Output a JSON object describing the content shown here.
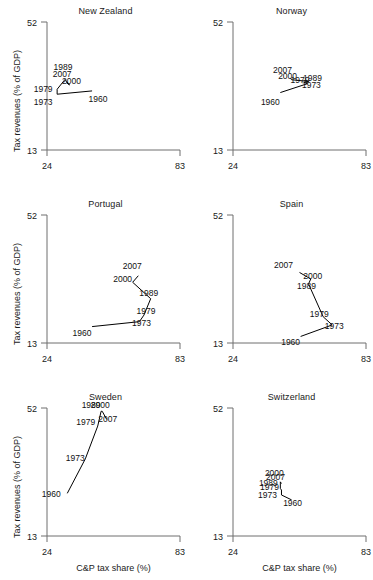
{
  "figure": {
    "axis_labels": {
      "y": "Tax revenues (% of GDP)",
      "x": "C&P tax share (%)"
    },
    "ticks": {
      "y_min": "13",
      "y_max": "52",
      "x_min": "24",
      "x_max": "83"
    },
    "colors": {
      "axis": "#6e6e6e",
      "data_line": "#000000",
      "text": "#1a1a1a",
      "background": "#ffffff"
    }
  },
  "chart_data": {
    "type": "line",
    "title": "",
    "xlabel": "C&P tax share (%)",
    "ylabel": "Tax revenues (% of GDP)",
    "xlim": [
      24,
      83
    ],
    "ylim": [
      13,
      52
    ],
    "grid": false,
    "legend": "none",
    "annotation_note": "Each panel is a connected scatter of one country over time; each point is labelled with its year.",
    "panels": [
      {
        "name": "New Zealand",
        "years": [
          "1960",
          "1973",
          "1979",
          "1989",
          "2000",
          "2007"
        ],
        "x": [
          44.0,
          28.5,
          28.5,
          32.0,
          34.0,
          32.5
        ],
        "y": [
          31.0,
          30.0,
          31.5,
          34.5,
          32.8,
          33.6
        ],
        "label_offsets": [
          {
            "dx": 6,
            "dy": 11
          },
          {
            "dx": -14,
            "dy": 11
          },
          {
            "dx": -14,
            "dy": 3
          },
          {
            "dx": -2,
            "dy": -9
          },
          {
            "dx": 2,
            "dy": -1
          },
          {
            "dx": -4,
            "dy": -5
          }
        ]
      },
      {
        "name": "Norway",
        "years": [
          "1960",
          "1973",
          "1979",
          "1989",
          "2000",
          "2007"
        ],
        "x": [
          45.0,
          57.0,
          55.5,
          57.5,
          50.0,
          49.5
        ],
        "y": [
          30.5,
          33.2,
          33.6,
          33.9,
          34.4,
          34.8
        ],
        "label_offsets": [
          {
            "dx": -10,
            "dy": 12
          },
          {
            "dx": 4,
            "dy": 4
          },
          {
            "dx": -4,
            "dy": 1
          },
          {
            "dx": 4,
            "dy": 0
          },
          {
            "dx": -4,
            "dy": -1
          },
          {
            "dx": -8,
            "dy": -5
          }
        ]
      },
      {
        "name": "Portugal",
        "years": [
          "1960",
          "1973",
          "1979",
          "1989",
          "2000",
          "2007"
        ],
        "x": [
          44.0,
          65.0,
          67.0,
          70.0,
          62.0,
          64.5
        ],
        "y": [
          18.0,
          19.5,
          21.5,
          26.5,
          31.5,
          33.5
        ],
        "label_offsets": [
          {
            "dx": -10,
            "dy": 9
          },
          {
            "dx": 2,
            "dy": 4
          },
          {
            "dx": 2,
            "dy": -1
          },
          {
            "dx": -2,
            "dy": -3
          },
          {
            "dx": -10,
            "dy": 0
          },
          {
            "dx": -6,
            "dy": -7
          }
        ]
      },
      {
        "name": "Spain",
        "years": [
          "1960",
          "1973",
          "1979",
          "1989",
          "2000",
          "2007"
        ],
        "x": [
          54.0,
          68.0,
          64.0,
          57.5,
          58.5,
          53.5
        ],
        "y": [
          15.0,
          18.5,
          21.0,
          31.0,
          32.5,
          34.5
        ],
        "label_offsets": [
          {
            "dx": -10,
            "dy": 9
          },
          {
            "dx": 2,
            "dy": 4
          },
          {
            "dx": -4,
            "dy": 0
          },
          {
            "dx": -2,
            "dy": 5
          },
          {
            "dx": 2,
            "dy": 0
          },
          {
            "dx": -16,
            "dy": -4
          }
        ]
      },
      {
        "name": "Sweden",
        "years": [
          "1960",
          "1973",
          "1979",
          "1989",
          "2000",
          "2007"
        ],
        "x": [
          33.0,
          41.0,
          46.5,
          48.0,
          48.5,
          50.5
        ],
        "y": [
          26.0,
          36.5,
          46.5,
          51.0,
          51.0,
          48.5
        ],
        "label_offsets": [
          {
            "dx": -16,
            "dy": 4
          },
          {
            "dx": -10,
            "dy": 2
          },
          {
            "dx": -12,
            "dy": -1
          },
          {
            "dx": -10,
            "dy": -3
          },
          {
            "dx": -2,
            "dy": -3
          },
          {
            "dx": 1,
            "dy": 3
          }
        ]
      },
      {
        "name": "Switzerland",
        "years": [
          "1960",
          "1973",
          "1979",
          "1989",
          "2000",
          "2007"
        ],
        "x": [
          50.0,
          45.5,
          45.5,
          45.0,
          45.0,
          45.5
        ],
        "y": [
          24.0,
          25.5,
          27.0,
          27.5,
          29.5,
          29.0
        ],
        "label_offsets": [
          {
            "dx": 1,
            "dy": 6
          },
          {
            "dx": -14,
            "dy": 3
          },
          {
            "dx": -12,
            "dy": 0
          },
          {
            "dx": -12,
            "dy": -2
          },
          {
            "dx": -6,
            "dy": -6
          },
          {
            "dx": -6,
            "dy": -3
          }
        ]
      }
    ]
  }
}
